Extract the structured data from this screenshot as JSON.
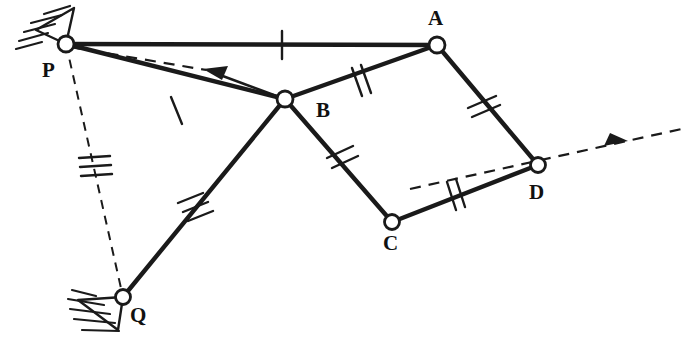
{
  "figure": {
    "type": "kinematic-linkage-diagram",
    "width": 686,
    "height": 346,
    "background_color": "#ffffff",
    "line_color": "#1a1a1a"
  },
  "joints": [
    {
      "id": "P",
      "label": "P",
      "x": 66,
      "y": 44,
      "kind": "grounded-pivot",
      "label_x": 42,
      "label_y": 60,
      "ground_symbol": "hatched-triangle-upper-left"
    },
    {
      "id": "A",
      "label": "A",
      "x": 437,
      "y": 45,
      "kind": "pin-joint",
      "label_x": 428,
      "label_y": 8
    },
    {
      "id": "B",
      "label": "B",
      "x": 285,
      "y": 99,
      "kind": "pin-joint",
      "label_x": 316,
      "label_y": 100
    },
    {
      "id": "C",
      "label": "C",
      "x": 392,
      "y": 222,
      "kind": "pin-joint",
      "label_x": 383,
      "label_y": 233
    },
    {
      "id": "D",
      "label": "D",
      "x": 538,
      "y": 165,
      "kind": "pin-joint",
      "label_x": 529,
      "label_y": 182
    },
    {
      "id": "Q",
      "label": "Q",
      "x": 123,
      "y": 297,
      "kind": "grounded-pivot",
      "label_x": 130,
      "label_y": 305,
      "ground_symbol": "hatched-triangle-left"
    }
  ],
  "links": [
    {
      "id": "PA",
      "from": "P",
      "to": "A",
      "style": "solid",
      "ticks": 1,
      "tick_pos": 0.58
    },
    {
      "id": "AB",
      "from": "A",
      "to": "B",
      "style": "solid",
      "ticks": 2,
      "tick_pos": 0.49
    },
    {
      "id": "AD",
      "from": "A",
      "to": "D",
      "style": "solid",
      "ticks": 2,
      "tick_pos": 0.49
    },
    {
      "id": "BC",
      "from": "B",
      "to": "C",
      "style": "solid",
      "ticks": 2,
      "tick_pos": 0.53
    },
    {
      "id": "CD",
      "from": "C",
      "to": "D",
      "style": "solid",
      "ticks": 2,
      "tick_pos": 0.47
    },
    {
      "id": "PB",
      "from": "P",
      "to": "B",
      "style": "solid",
      "ticks": 1,
      "tick_pos": 0.51
    },
    {
      "id": "QB",
      "from": "Q",
      "to": "B",
      "style": "solid",
      "ticks": 3,
      "tick_pos": 0.43
    },
    {
      "id": "PQ",
      "from": "P",
      "to": "Q",
      "style": "dashed",
      "ticks": 3,
      "tick_pos": 0.49
    }
  ],
  "vectors": [
    {
      "id": "velocity-at-B",
      "style": "dashed-arrow",
      "from_x": 285,
      "from_y": 99,
      "to_x": 205,
      "to_y": 70,
      "tail_x": 70,
      "tail_y": 47,
      "description": "dashed arrow from P through B region pointing left"
    },
    {
      "id": "velocity-at-D",
      "style": "dashed-arrow",
      "from_x": 410,
      "from_y": 189,
      "to_x": 686,
      "to_y": 128,
      "description": "dashed arrow through D pointing upper right"
    }
  ],
  "ground_hatching": {
    "P": {
      "count": 5,
      "angle_deg": 200
    },
    "Q": {
      "count": 5,
      "angle_deg": 200
    }
  }
}
